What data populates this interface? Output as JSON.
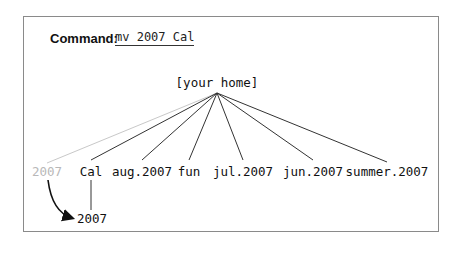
{
  "command": {
    "label": "Command:",
    "value": "mv 2007 Cal"
  },
  "tree": {
    "root": "[your home]",
    "children": [
      {
        "label": "2007",
        "state": "moved-away"
      },
      {
        "label": "Cal",
        "state": "normal"
      },
      {
        "label": "aug.2007",
        "state": "normal"
      },
      {
        "label": "fun",
        "state": "normal"
      },
      {
        "label": "jul.2007",
        "state": "normal"
      },
      {
        "label": "jun.2007",
        "state": "normal"
      },
      {
        "label": "summer.2007",
        "state": "normal"
      }
    ],
    "moved_node": {
      "label": "2007",
      "parent": "Cal"
    },
    "colors": {
      "ghost": "#b8b8b8",
      "line": "#333333",
      "ghost_line": "#c8c8c8"
    }
  }
}
